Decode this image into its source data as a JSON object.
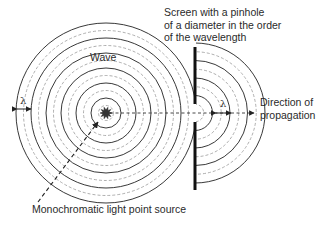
{
  "labels": {
    "screen": [
      "Screen with a pinhole",
      "of a diameter in the order",
      "of the wavelength"
    ],
    "wave": "Wave",
    "direction": [
      "Direction of",
      "propagation"
    ],
    "source": "Monochromatic light point source",
    "lambda_left": "λ",
    "lambda_right": "λ"
  },
  "diagram": {
    "incident_wavefronts": {
      "solid_count": 6,
      "dashed_count": 6
    },
    "diffracted_wavefronts": {
      "solid_count": 4,
      "dashed_count": 4
    },
    "colors": {
      "solid": "#222222",
      "dashed": "#9a9a9a",
      "text": "#2a2a2a"
    }
  }
}
